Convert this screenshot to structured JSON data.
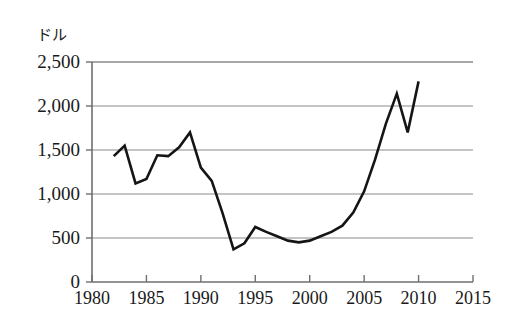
{
  "chart_data": {
    "type": "line",
    "title": "",
    "subtitle": "",
    "xlabel": "",
    "ylabel": "ドル",
    "ylabel_position": "top-left",
    "grid": true,
    "legend": "none",
    "xlim": [
      1980,
      2015
    ],
    "ylim": [
      0,
      2500
    ],
    "x_tick_labels": [
      "1980",
      "1985",
      "1990",
      "1995",
      "2000",
      "2005",
      "2010",
      "2015"
    ],
    "x_ticks": [
      1980,
      1985,
      1990,
      1995,
      2000,
      2005,
      2010,
      2015
    ],
    "y_tick_labels": [
      "0",
      "500",
      "1,000",
      "1,500",
      "2,000",
      "2,500"
    ],
    "y_ticks": [
      0,
      500,
      1000,
      1500,
      2000,
      2500
    ],
    "series": [
      {
        "name": "value",
        "color": "#151515",
        "x": [
          1982,
          1983,
          1984,
          1985,
          1986,
          1987,
          1988,
          1989,
          1990,
          1991,
          1992,
          1993,
          1994,
          1995,
          1996,
          1997,
          1998,
          1999,
          2000,
          2001,
          2002,
          2003,
          2004,
          2005,
          2006,
          2007,
          2008,
          2009,
          2010
        ],
        "values": [
          1430,
          1550,
          1120,
          1170,
          1440,
          1430,
          1530,
          1700,
          1300,
          1150,
          780,
          370,
          440,
          625,
          570,
          520,
          470,
          450,
          470,
          520,
          570,
          640,
          790,
          1030,
          1390,
          1800,
          2140,
          1700,
          2280
        ]
      }
    ]
  },
  "axis": {
    "unit_label": "ドル"
  }
}
